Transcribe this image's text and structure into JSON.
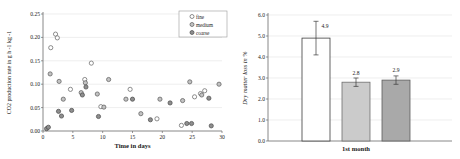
{
  "figure": {
    "background": "#ffffff",
    "text_color": "#1a1a1a",
    "grid_color": "#e3e3e3",
    "axis_color": "#6b6b6b"
  },
  "chart_data": [
    {
      "type": "scatter",
      "title": "",
      "xlabel": "Time in days",
      "ylabel": "CO2 production rate in g h -1 kg -1",
      "xlim": [
        0,
        30
      ],
      "ylim": [
        0,
        0.25
      ],
      "xticks": [
        "0",
        "5",
        "10",
        "15",
        "20",
        "25",
        "30"
      ],
      "yticks": [
        "0.00",
        "0.05",
        "0.10",
        "0.15",
        "0.20",
        "0.25"
      ],
      "grid": "horizontal",
      "legend_position": "top-right",
      "series": [
        {
          "name": "fine",
          "marker": "circle-open",
          "fill": "#ffffff",
          "stroke": "#5f5f5f",
          "points": [
            [
              1.3,
              0.178
            ],
            [
              2.1,
              0.207
            ],
            [
              2.4,
              0.199
            ],
            [
              4.6,
              0.089
            ],
            [
              7.0,
              0.11
            ],
            [
              8.1,
              0.145
            ],
            [
              9.7,
              0.052
            ],
            [
              14.6,
              0.089
            ],
            [
              19.1,
              0.026
            ],
            [
              23.2,
              0.012
            ],
            [
              25.4,
              0.073
            ],
            [
              26.4,
              0.08
            ],
            [
              27.1,
              0.086
            ]
          ]
        },
        {
          "name": "medium",
          "marker": "circle-filled",
          "fill": "#c3c3c3",
          "stroke": "#585858",
          "points": [
            [
              1.2,
              0.122
            ],
            [
              2.7,
              0.106
            ],
            [
              3.4,
              0.068
            ],
            [
              6.4,
              0.082
            ],
            [
              7.1,
              0.103
            ],
            [
              9.1,
              0.079
            ],
            [
              10.2,
              0.051
            ],
            [
              11.0,
              0.11
            ],
            [
              13.9,
              0.068
            ],
            [
              16.4,
              0.037
            ],
            [
              19.6,
              0.068
            ],
            [
              23.4,
              0.065
            ],
            [
              24.6,
              0.105
            ],
            [
              26.6,
              0.077
            ],
            [
              29.5,
              0.1
            ]
          ]
        },
        {
          "name": "coarse",
          "marker": "circle-filled",
          "fill": "#8e8e8e",
          "stroke": "#474747",
          "points": [
            [
              0.6,
              0.005
            ],
            [
              0.9,
              0.008
            ],
            [
              2.6,
              0.042
            ],
            [
              3.1,
              0.032
            ],
            [
              4.8,
              0.044
            ],
            [
              6.6,
              0.077
            ],
            [
              7.2,
              0.094
            ],
            [
              9.3,
              0.031
            ],
            [
              15.0,
              0.068
            ],
            [
              18.0,
              0.024
            ],
            [
              21.3,
              0.06
            ],
            [
              24.1,
              0.016
            ],
            [
              24.9,
              0.016
            ],
            [
              27.8,
              0.07
            ],
            [
              28.2,
              0.011
            ]
          ]
        }
      ]
    },
    {
      "type": "bar",
      "title": "",
      "xlabel": "1st month",
      "ylabel": "Dry matter loss in %",
      "ylim": [
        0,
        6
      ],
      "yticks": [
        "0.0",
        "1.0",
        "2.0",
        "3.0",
        "4.0",
        "5.0",
        "6.0"
      ],
      "grid": "horizontal",
      "bars": [
        {
          "name": "fine",
          "value": 4.9,
          "label": "4.9",
          "error": 0.8,
          "fill": "#ffffff",
          "stroke": "#3d3d3d"
        },
        {
          "name": "medium",
          "value": 2.8,
          "label": "2.8",
          "error": 0.2,
          "fill": "#cbcbcb",
          "stroke": "#6e6e6e"
        },
        {
          "name": "coarse",
          "value": 2.9,
          "label": "2.9",
          "error": 0.2,
          "fill": "#a9a9a9",
          "stroke": "#5c5c5c"
        }
      ]
    }
  ]
}
